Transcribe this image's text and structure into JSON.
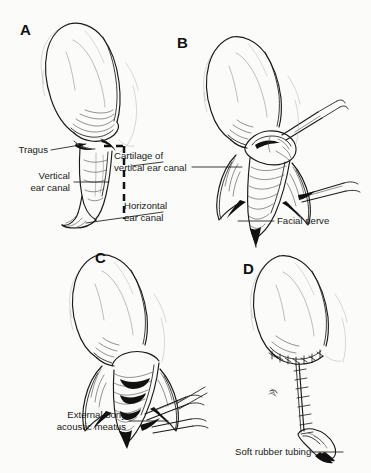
{
  "figure": {
    "kind": "medical-line-art-illustration",
    "background_color": "#fbfbfa",
    "ink_color": "#1a1a1a",
    "panel_count": 4
  },
  "panels": [
    {
      "letter": "A",
      "name": "panel-a-intact-ear-with-incision-lines",
      "description": "Intact pendulous ear pinna viewed laterally with dashed incision lines marking the vertical ear canal",
      "labels": [
        {
          "text": "Tragus",
          "name": "label-tragus"
        },
        {
          "text": "Vertical\near canal",
          "name": "label-vertical-ear-canal"
        },
        {
          "text": "Cartilage of\nvertical ear canal",
          "name": "label-cartilage-of-vertical-ear-canal"
        },
        {
          "text": "Horizontal\near canal",
          "name": "label-horizontal-ear-canal"
        }
      ]
    },
    {
      "letter": "B",
      "name": "panel-b-exposed-canal-with-retractors",
      "description": "Ear canal exposed by reflected skin flaps with surgical instruments retracting tissue",
      "labels": [
        {
          "text": "Facial nerve",
          "name": "label-facial-nerve"
        }
      ]
    },
    {
      "letter": "C",
      "name": "panel-c-deep-dissection-with-forceps",
      "description": "Deeper dissection of the ear canal down to the bony meatus with forceps in place",
      "labels": [
        {
          "text": "External bony\nacoustic meatus",
          "name": "label-external-bony-acoustic-meatus"
        }
      ]
    },
    {
      "letter": "D",
      "name": "panel-d-sutured-closure-with-drain",
      "description": "Completed closure with interrupted sutures and a soft rubber drain exiting ventrally",
      "labels": [
        {
          "text": "Soft rubber tubing",
          "name": "label-soft-rubber-tubing"
        }
      ]
    }
  ]
}
